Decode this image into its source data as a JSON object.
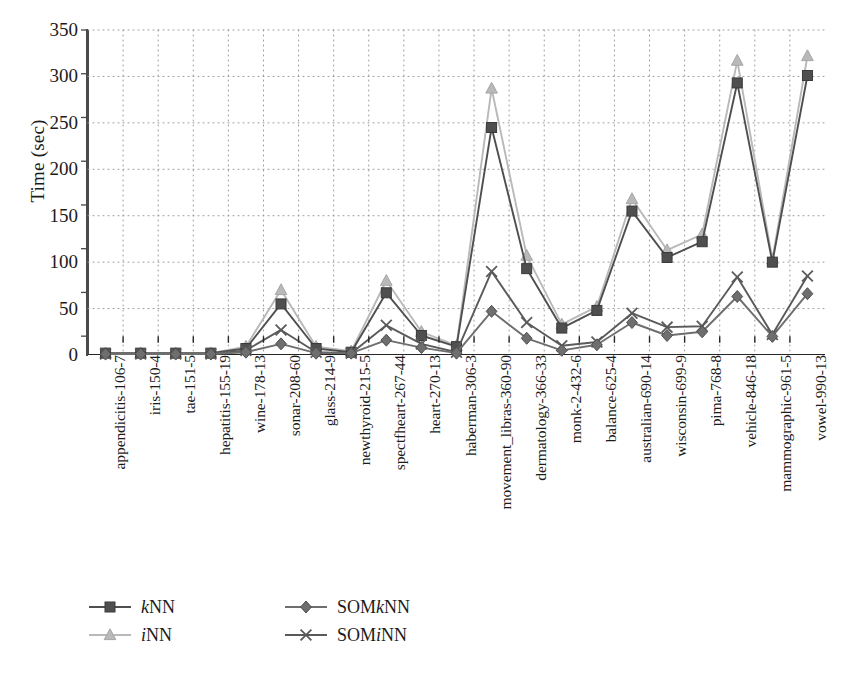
{
  "chart_data": {
    "type": "line",
    "title": "",
    "xlabel": "",
    "ylabel": "Time (sec)",
    "ylim": [
      0,
      350
    ],
    "yticks": [
      0,
      50,
      100,
      150,
      200,
      250,
      300,
      350
    ],
    "grid": "dotted",
    "legend_position": "bottom-left",
    "categories": [
      "appendicitis-106-7",
      "iris-150-4",
      "tae-151-5",
      "hepatitis-155-19",
      "wine-178-13",
      "sonar-208-60",
      "glass-214-9",
      "newthyroid-215-5",
      "spectfheart-267-44",
      "heart-270-13",
      "haberman-306-3",
      "movement_libras-360-90",
      "dermatology-366-33",
      "monk-2-432-6",
      "balance-625-4",
      "australian-690-14",
      "wisconsin-699-9",
      "pima-768-8",
      "vehicle-846-18",
      "mammographic-961-5",
      "vowel-990-13"
    ],
    "series": [
      {
        "name": "kNN",
        "marker": "square",
        "color": "#4f4f4f",
        "values": [
          2,
          2,
          2,
          2,
          7,
          55,
          7,
          3,
          67,
          21,
          9,
          245,
          93,
          29,
          48,
          155,
          105,
          122,
          293,
          100,
          301
        ]
      },
      {
        "name": "iNN",
        "marker": "triangle",
        "color": "#b9b9b9",
        "values": [
          2,
          2,
          2,
          2,
          9,
          70,
          9,
          4,
          80,
          25,
          10,
          287,
          107,
          33,
          52,
          168,
          113,
          130,
          317,
          103,
          322
        ]
      },
      {
        "name": "SOMkNN",
        "marker": "diamond",
        "color": "#6e6e6e",
        "values": [
          1,
          1,
          1,
          1,
          3,
          12,
          2,
          2,
          16,
          8,
          2,
          47,
          18,
          5,
          11,
          35,
          21,
          25,
          63,
          20,
          66
        ]
      },
      {
        "name": "SOMiNN",
        "marker": "cross",
        "color": "#5a5a5a",
        "values": [
          1,
          1,
          1,
          1,
          5,
          27,
          3,
          2,
          32,
          12,
          3,
          90,
          35,
          10,
          14,
          45,
          30,
          31,
          84,
          22,
          85
        ]
      }
    ]
  },
  "legend": {
    "items": [
      {
        "label_pre": "",
        "label_em": "k",
        "label_post": "NN",
        "marker": "square"
      },
      {
        "label_pre": "",
        "label_em": "i",
        "label_post": "NN",
        "marker": "triangle"
      },
      {
        "label_pre": "SOM",
        "label_em": "k",
        "label_post": "NN",
        "marker": "diamond"
      },
      {
        "label_pre": "SOM",
        "label_em": "i",
        "label_post": "NN",
        "marker": "cross"
      }
    ]
  },
  "colors": {
    "knn": "#4f4f4f",
    "inn": "#b9b9b9",
    "somknn": "#6e6e6e",
    "sominn": "#5a5a5a",
    "axis": "#262626",
    "grid": "#9a9a9a",
    "background": "#ffffff"
  }
}
